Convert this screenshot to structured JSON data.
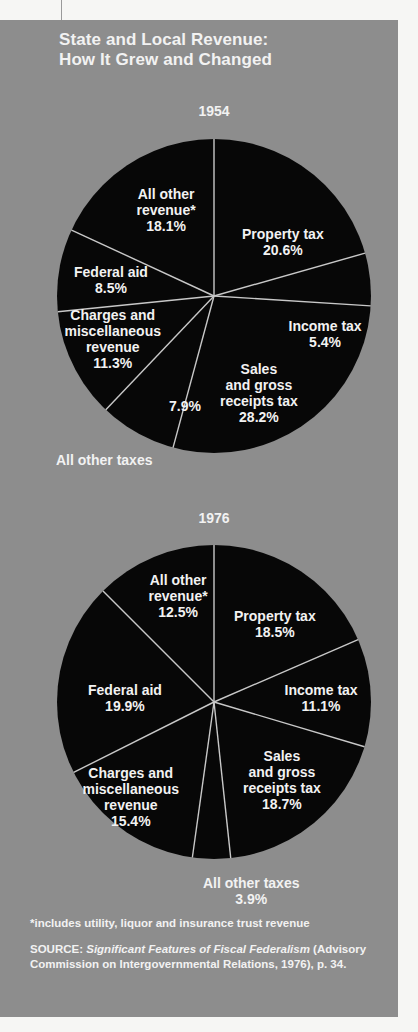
{
  "title": {
    "line1": "State and Local Revenue:",
    "line2": "How It Grew and Changed"
  },
  "footnote": "*includes utility, liquor and insurance trust revenue",
  "source": {
    "prefix": "SOURCE: ",
    "italic": "Significant Features of Fiscal Federalism",
    "rest": " (Advisory Commission on Intergovernmental Relations, 1976), p. 34."
  },
  "colors": {
    "panel": "#8d8d8d",
    "slice": "#070707",
    "divider": "#c8c8c8",
    "text": "#f2f2f2"
  },
  "chart_data": [
    {
      "type": "pie",
      "title": "1954",
      "categories": [
        "Property tax",
        "Income tax",
        "Sales and gross receipts tax",
        "All other taxes",
        "Charges and miscellaneous revenue",
        "Federal aid",
        "All other revenue*"
      ],
      "values": [
        20.6,
        5.4,
        28.2,
        7.9,
        11.3,
        8.5,
        18.1
      ],
      "units": "%",
      "start_angle": "12 o'clock, clockwise"
    },
    {
      "type": "pie",
      "title": "1976",
      "categories": [
        "Property tax",
        "Income tax",
        "Sales and gross receipts tax",
        "All other taxes",
        "Charges and miscellaneous revenue",
        "Federal aid",
        "All other revenue*"
      ],
      "values": [
        18.5,
        11.1,
        18.7,
        3.9,
        15.4,
        19.9,
        12.5
      ],
      "units": "%",
      "start_angle": "12 o'clock, clockwise"
    }
  ],
  "labels1954": {
    "property": [
      "Property tax",
      "20.6%"
    ],
    "income": [
      "Income tax",
      "5.4%"
    ],
    "sales": [
      "Sales",
      "and gross",
      "receipts tax",
      "28.2%"
    ],
    "othertaxes_value": "7.9%",
    "othertaxes_name": "All other taxes",
    "charges": [
      "Charges and",
      "miscellaneous",
      "revenue",
      "11.3%"
    ],
    "federal": [
      "Federal aid",
      "8.5%"
    ],
    "otherrev": [
      "All other",
      "revenue*",
      "18.1%"
    ]
  },
  "labels1976": {
    "property": [
      "Property tax",
      "18.5%"
    ],
    "income": [
      "Income tax",
      "11.1%"
    ],
    "sales": [
      "Sales",
      "and gross",
      "receipts tax",
      "18.7%"
    ],
    "othertaxes": [
      "All other taxes",
      "3.9%"
    ],
    "charges": [
      "Charges and",
      "miscellaneous",
      "revenue",
      "15.4%"
    ],
    "federal": [
      "Federal aid",
      "19.9%"
    ],
    "otherrev": [
      "All other",
      "revenue*",
      "12.5%"
    ]
  }
}
